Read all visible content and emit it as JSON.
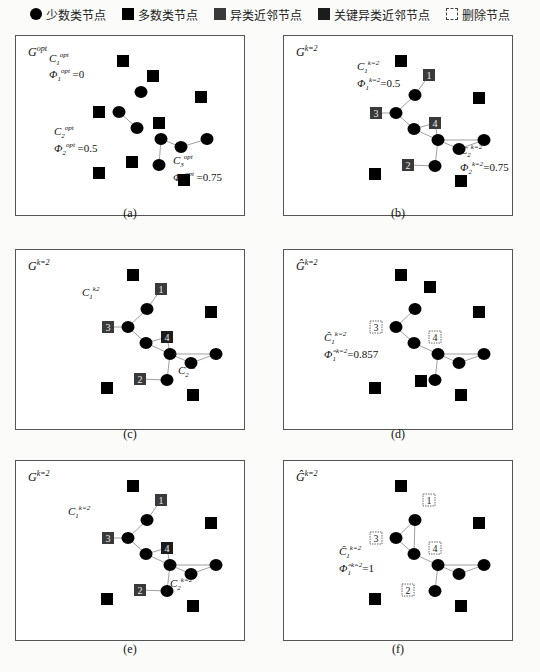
{
  "legend": [
    {
      "icon": "minority-node-icon",
      "label": "少数类节点"
    },
    {
      "icon": "majority-node-icon",
      "label": "多数类节点"
    },
    {
      "icon": "heterophilous-neighbor-icon",
      "label": "异类近邻节点"
    },
    {
      "icon": "key-heterophilous-neighbor-icon",
      "label": "关键异类近邻节点"
    },
    {
      "icon": "deleted-node-icon",
      "label": "删除节点"
    }
  ],
  "colors": {
    "minority": "#000000",
    "majority": "#000000",
    "neighbor": "#3a3a3a",
    "key_neighbor": "#1c1c1c",
    "deleted_border": "#444444",
    "edge": "#888888"
  },
  "panels": [
    {
      "id": "a",
      "caption": "(a)",
      "graph_label": "G",
      "graph_sup": "opt",
      "labels": [
        {
          "text": "C",
          "sub": "1",
          "sup": "opt",
          "x": 33,
          "y": 16
        },
        {
          "text": "Φ",
          "sub": "1",
          "sup": "opt",
          "val": " =0",
          "x": 33,
          "y": 32
        },
        {
          "text": "C",
          "sub": "2",
          "sup": "opt",
          "x": 38,
          "y": 89
        },
        {
          "text": "Φ",
          "sub": "2",
          "sup": "opt",
          "val": " =0.5",
          "x": 38,
          "y": 106
        },
        {
          "text": "C",
          "sub": "3",
          "sup": "opt",
          "x": 157,
          "y": 118
        },
        {
          "text": "Φ",
          "sub": "3",
          "sup": "opt",
          "val": " =0.75",
          "x": 157,
          "y": 135
        }
      ]
    },
    {
      "id": "b",
      "caption": "(b)",
      "graph_label": "G",
      "graph_sup": "k=2",
      "labels": [
        {
          "text": "C",
          "sub": "1",
          "sup": "k=2",
          "x": 73,
          "y": 24
        },
        {
          "text": "Φ",
          "sub": "1",
          "sup": "k=2",
          "val": "=0.5",
          "x": 73,
          "y": 41
        },
        {
          "text": "C",
          "sub": "2",
          "sup": "k=2",
          "x": 176,
          "y": 108
        },
        {
          "text": "Φ",
          "sub": "2",
          "sup": "k=2",
          "val": "=0.75",
          "x": 176,
          "y": 125
        }
      ]
    },
    {
      "id": "c",
      "caption": "(c)",
      "graph_label": "G",
      "graph_sup": "k=2",
      "labels": [
        {
          "text": "C",
          "sub": "1",
          "sup": "k2",
          "x": 66,
          "y": 36
        },
        {
          "text": "C",
          "sub": "2",
          "sup": "k2",
          "x": 162,
          "y": 114
        }
      ]
    },
    {
      "id": "d",
      "caption": "(d)",
      "graph_label": "Ĝ",
      "graph_sup": "k=2",
      "labels": [
        {
          "text": "Ĉ",
          "sub": "1",
          "sup": "k=2",
          "x": 40,
          "y": 81
        },
        {
          "text": "Φ̂",
          "sub": "1",
          "sup": "k=2",
          "val": "=0.857",
          "x": 40,
          "y": 98
        }
      ]
    },
    {
      "id": "e",
      "caption": "(e)",
      "graph_label": "G",
      "graph_sup": "k=2",
      "labels": [
        {
          "text": "C",
          "sub": "1",
          "sup": "k=2",
          "x": 52,
          "y": 44
        },
        {
          "text": "C",
          "sub": "2",
          "sup": "k=2",
          "x": 154,
          "y": 116
        }
      ]
    },
    {
      "id": "f",
      "caption": "(f)",
      "graph_label": "Ĝ",
      "graph_sup": "k=2",
      "labels": [
        {
          "text": "Ĉ",
          "sub": "1",
          "sup": "k=2",
          "x": 55,
          "y": 84
        },
        {
          "text": "Φ̂",
          "sub": "1",
          "sup": "k=2",
          "val": "=1",
          "x": 55,
          "y": 101
        }
      ]
    }
  ],
  "node_labels": {
    "n1": "1",
    "n2": "2",
    "n3": "3",
    "n4": "4"
  }
}
